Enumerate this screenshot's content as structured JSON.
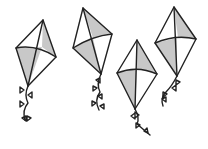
{
  "scene": {
    "description": "Four line-drawn kites with gray shading and bow-tied tails",
    "background_color": "#ffffff",
    "stroke_color": "#222222",
    "shade_color": "#c8c8c8",
    "kite_count": 4
  },
  "kites": [
    {
      "name": "kite-1"
    },
    {
      "name": "kite-2"
    },
    {
      "name": "kite-3"
    },
    {
      "name": "kite-4"
    }
  ]
}
